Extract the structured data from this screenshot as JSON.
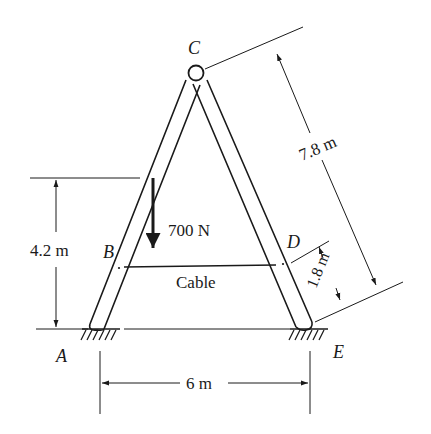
{
  "diagram": {
    "type": "A-frame with cable",
    "colors": {
      "ink": "#1a1a1a",
      "background": "#ffffff"
    },
    "points": {
      "A": {
        "label": "A"
      },
      "B": {
        "label": "B"
      },
      "C": {
        "label": "C"
      },
      "D": {
        "label": "D"
      },
      "E": {
        "label": "E"
      }
    },
    "load": {
      "label": "700 N",
      "direction": "down"
    },
    "cable": {
      "label": "Cable"
    },
    "dimensions": {
      "height_B": "4.2 m",
      "length_CE": "7.8 m",
      "length_DE": "1.8 m",
      "span_AE": "6 m"
    }
  }
}
